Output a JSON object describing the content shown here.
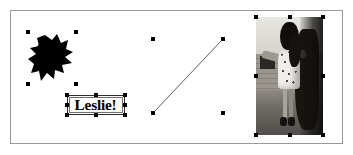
{
  "app": {
    "surface_label": "drawing-canvas",
    "background_color": "#ffffff",
    "frame_border_color": "#9a9a9a",
    "selection_handle_color": "#000000"
  },
  "canvas": {
    "objects": [
      {
        "id": "freeform-blob",
        "type": "shape",
        "name": "Freeform black blob",
        "fill_color": "#000000",
        "selected": true,
        "handle_count": 4,
        "bounds": {
          "x": 17,
          "y": 21,
          "width": 48,
          "height": 52
        }
      },
      {
        "id": "text-leslie",
        "type": "text",
        "name": "Text box",
        "text": "Leslie!",
        "font_style": "bold serif",
        "text_color": "#000000",
        "border_color": "#2b2b2b",
        "selected": true,
        "handle_count": 8,
        "bounds": {
          "x": 56,
          "y": 84,
          "width": 58,
          "height": 20
        }
      },
      {
        "id": "diagonal-line",
        "type": "line",
        "name": "Diagonal line",
        "stroke_color": "#5c5c5c",
        "stroke_width": 1,
        "selected": true,
        "handle_count": 4,
        "bounds": {
          "x": 142,
          "y": 28,
          "width": 70,
          "height": 74
        },
        "start_point": {
          "x": 143,
          "y": 101
        },
        "end_point": {
          "x": 211,
          "y": 29
        }
      },
      {
        "id": "photo-child",
        "type": "image",
        "name": "Black and white photograph of a child standing outdoors",
        "selected": true,
        "handle_count": 8,
        "bounds": {
          "x": 245,
          "y": 6,
          "width": 67,
          "height": 118
        }
      }
    ]
  }
}
